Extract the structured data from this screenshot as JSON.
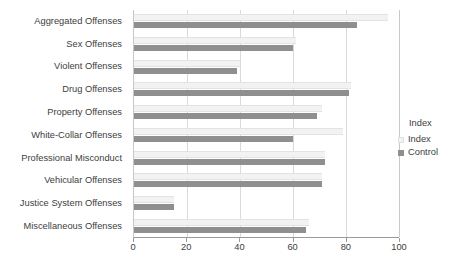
{
  "chart_data": {
    "type": "bar",
    "orientation": "horizontal",
    "title": "",
    "xlabel": "",
    "ylabel": "",
    "xlim": [
      0,
      100
    ],
    "xticks": [
      0,
      20,
      40,
      60,
      80,
      100
    ],
    "grid": true,
    "legend_position": "right",
    "legend_title": "Index",
    "categories": [
      "Aggregated Offenses",
      "Sex Offenses",
      "Violent Offenses",
      "Drug Offenses",
      "Property Offenses",
      "White-Collar Offenses",
      "Professional Misconduct",
      "Vehicular Offenses",
      "Justice System Offenses",
      "Miscellaneous Offenses"
    ],
    "series": [
      {
        "name": "Index",
        "color": "#f2f2f2",
        "values": [
          96,
          61,
          40,
          82,
          71,
          79,
          72,
          71,
          15,
          66
        ]
      },
      {
        "name": "Control",
        "color": "#8f8f8f",
        "values": [
          84,
          60,
          39,
          81,
          69,
          60,
          72,
          71,
          15,
          65
        ]
      }
    ]
  },
  "legend": {
    "title": "Index",
    "items": [
      {
        "label": "Index"
      },
      {
        "label": "Control"
      }
    ]
  },
  "axis": {
    "x_tick_labels": [
      "0",
      "20",
      "40",
      "60",
      "80",
      "100"
    ]
  }
}
